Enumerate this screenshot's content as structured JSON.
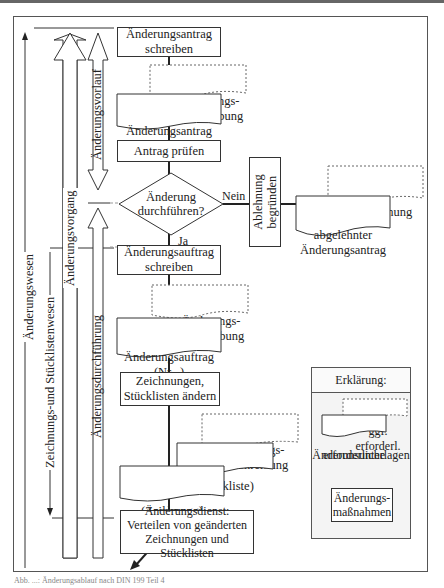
{
  "diagram": {
    "steps": {
      "antrag_schreiben": "Änderungsantrag\nschreiben",
      "beschreibung_1": "Änderungs-\nbeschreibung",
      "antrag_nr": "Änderungsantrag\n(Nr...)",
      "antrag_pruefen": "Antrag prüfen",
      "decision": "Änderung\ndurchführen?",
      "decision_no": "Nein",
      "decision_yes": "Ja",
      "ablehnung_begruenden": "Ablehnung\nbegründen",
      "ablehnung_doc": "Ablehnung",
      "abgelehnter_antrag": "abgelehnter\nÄnderungsantrag",
      "auftrag_schreiben": "Änderungsauftrag\nschreiben",
      "beschreibung_2": "Änderungs-\nbeschreibung",
      "auftrag_nr": "Änderungsauftrag\n(Nr...)",
      "zeichnungen_aendern": "Zeichnungen,\nStücklisten ändern",
      "beschreibung_3": "Änderungs-\nbeschreibung",
      "stueckliste": "(Stückliste)",
      "zeichnung": "(Zeichnung)",
      "aenderungsdienst": "Änderungsdienst:\nVerteilen von geänderten\nZeichnungen und Stücklisten"
    },
    "side_labels": {
      "aenderungswesen": "Änderungswesen",
      "zeichnungs_stuecklistenwesen": "Zeichnungs-und Stücklistenwesen",
      "aenderungsvorgang": "Änderungsvorgang",
      "aenderungsvorlauf": "Änderungsvorlauf",
      "aenderungsdurchfuehrung": "Änderungsdurchführung"
    },
    "legend": {
      "title": "Erklärung:",
      "optional": "ggf. erforderl.",
      "required": "erforderliche",
      "documents_label": "Änderunsunterlagen",
      "measures": "Änderungs-\nmaßnahmen"
    },
    "caption": "Abb. ...: Änderungsablauf nach DIN 199 Teil 4"
  }
}
